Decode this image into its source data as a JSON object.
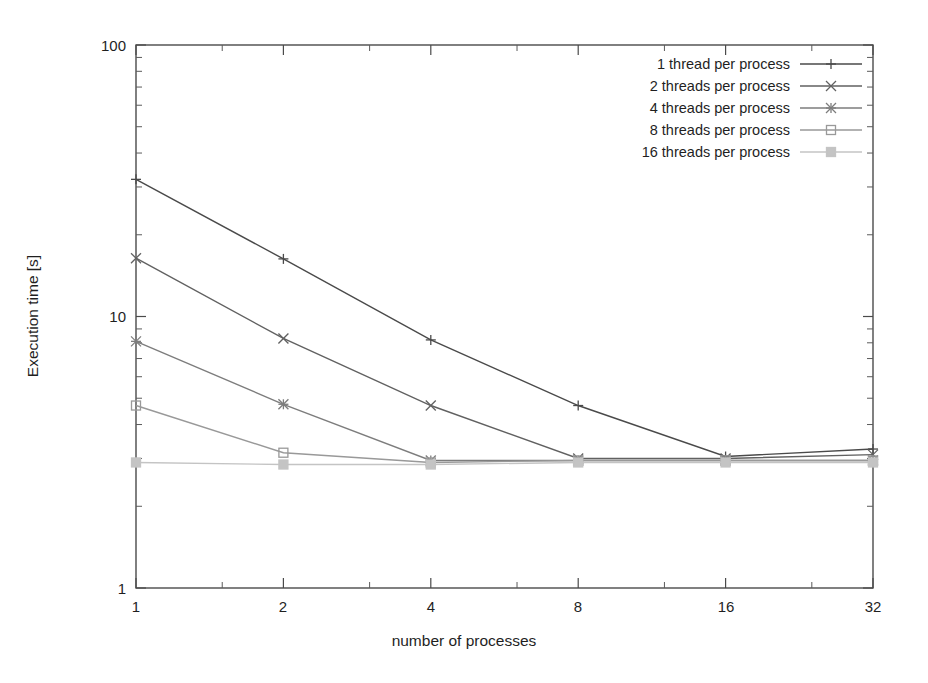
{
  "chart_data": {
    "type": "line",
    "title": "",
    "xlabel": "number of processes",
    "ylabel": "Execution time [s]",
    "xscale": "log2",
    "yscale": "log10",
    "xlim": [
      1,
      32
    ],
    "ylim": [
      1,
      100
    ],
    "xticks": [
      "1",
      "2",
      "4",
      "8",
      "16",
      "32"
    ],
    "xtick_values": [
      1,
      2,
      4,
      8,
      16,
      32
    ],
    "yticks": [
      "1",
      "10",
      "100"
    ],
    "ytick_values": [
      1,
      10,
      100
    ],
    "grid": false,
    "legend_position": "top-right",
    "x": [
      1,
      2,
      4,
      8,
      16,
      32
    ],
    "series": [
      {
        "name": "1 thread per process",
        "values": [
          32.0,
          16.3,
          8.2,
          4.7,
          3.05,
          3.25
        ],
        "color": "#4a4a4a",
        "marker": "plus"
      },
      {
        "name": "2 threads per process",
        "values": [
          16.4,
          8.3,
          4.7,
          3.0,
          3.0,
          3.1
        ],
        "color": "#616161",
        "marker": "cross"
      },
      {
        "name": "4 threads per process",
        "values": [
          8.1,
          4.75,
          2.95,
          2.95,
          2.95,
          2.95
        ],
        "color": "#7d7d7d",
        "marker": "star"
      },
      {
        "name": "8 threads per process",
        "values": [
          4.7,
          3.15,
          2.9,
          2.95,
          2.95,
          2.95
        ],
        "color": "#999999",
        "marker": "square-open"
      },
      {
        "name": "16 threads per process",
        "values": [
          2.9,
          2.85,
          2.85,
          2.9,
          2.9,
          2.9
        ],
        "color": "#c4c4c4",
        "marker": "square-filled"
      }
    ]
  },
  "axes": {
    "x_title": "number of processes",
    "y_title": "Execution time [s]"
  },
  "legend": {
    "entries": [
      {
        "label": "1 thread per process"
      },
      {
        "label": "2 threads per process"
      },
      {
        "label": "4 threads per process"
      },
      {
        "label": "8 threads per process"
      },
      {
        "label": "16 threads per process"
      }
    ]
  },
  "ticks": {
    "x": [
      "1",
      "2",
      "4",
      "8",
      "16",
      "32"
    ],
    "y": [
      "100",
      "10",
      "1"
    ]
  }
}
